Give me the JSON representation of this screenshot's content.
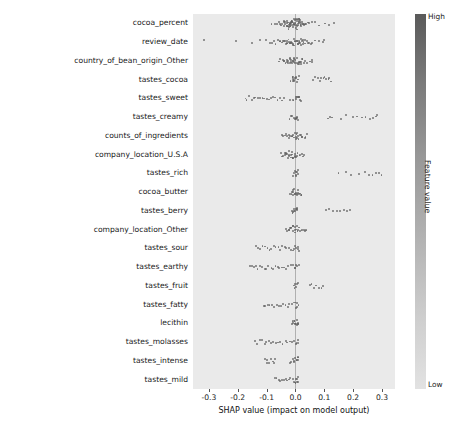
{
  "chart_data": {
    "type": "scatter",
    "title": "",
    "xlabel": "SHAP value (impact on model output)",
    "ylabel": "",
    "xlim": [
      -0.355,
      0.345
    ],
    "xticks": [
      -0.3,
      -0.2,
      -0.1,
      0.0,
      0.1,
      0.2,
      0.3
    ],
    "xticklabels": [
      "-0.3",
      "-0.2",
      "-0.1",
      "0.0",
      "0.1",
      "0.2",
      "0.3"
    ],
    "grid": false,
    "legend": {
      "position": "right",
      "title": "Feature value",
      "high_label": "High",
      "low_label": "Low"
    },
    "categories": [
      "cocoa_percent",
      "review_date",
      "country_of_bean_origin_Other",
      "tastes_cocoa",
      "tastes_sweet",
      "tastes_creamy",
      "counts_of_ingredients",
      "company_location_U.S.A",
      "tastes_rich",
      "cocoa_butter",
      "tastes_berry",
      "company_location_Other",
      "tastes_sour",
      "tastes_earthy",
      "tastes_fruit",
      "tastes_fatty",
      "lecithin",
      "tastes_molasses",
      "tastes_intense",
      "tastes_mild"
    ],
    "series": [
      {
        "name": "cocoa_percent",
        "min": -0.082,
        "max": 0.135,
        "points": [
          -0.082,
          -0.072,
          -0.066,
          -0.06,
          -0.055,
          -0.051,
          -0.048,
          -0.045,
          -0.042,
          -0.04,
          -0.038,
          -0.036,
          -0.034,
          -0.032,
          -0.03,
          -0.029,
          -0.027,
          -0.026,
          -0.024,
          -0.023,
          -0.022,
          -0.021,
          -0.02,
          -0.019,
          -0.018,
          -0.017,
          -0.016,
          -0.015,
          -0.014,
          -0.013,
          -0.012,
          -0.011,
          -0.01,
          -0.009,
          -0.008,
          -0.007,
          -0.006,
          -0.005,
          -0.004,
          -0.003,
          -0.002,
          -0.001,
          0.0,
          0.001,
          0.002,
          0.003,
          0.004,
          0.005,
          0.006,
          0.007,
          0.008,
          0.009,
          0.01,
          0.011,
          0.012,
          0.013,
          0.014,
          0.015,
          0.016,
          0.017,
          0.018,
          0.02,
          0.022,
          0.024,
          0.026,
          0.028,
          0.031,
          0.034,
          0.038,
          0.043,
          0.049,
          0.057,
          0.067,
          0.082,
          0.1,
          0.118,
          0.135
        ]
      },
      {
        "name": "review_date",
        "min": -0.32,
        "max": 0.1,
        "points": [
          -0.32,
          -0.205,
          -0.15,
          -0.12,
          -0.1,
          -0.09,
          -0.082,
          -0.075,
          -0.068,
          -0.062,
          -0.057,
          -0.052,
          -0.048,
          -0.044,
          -0.04,
          -0.037,
          -0.034,
          -0.031,
          -0.028,
          -0.026,
          -0.024,
          -0.022,
          -0.02,
          -0.018,
          -0.016,
          -0.014,
          -0.012,
          -0.01,
          -0.008,
          -0.006,
          -0.004,
          -0.002,
          0.0,
          0.002,
          0.004,
          0.006,
          0.008,
          0.01,
          0.012,
          0.014,
          0.016,
          0.018,
          0.02,
          0.022,
          0.024,
          0.026,
          0.028,
          0.031,
          0.034,
          0.038,
          0.042,
          0.047,
          0.053,
          0.06,
          0.07,
          0.082,
          0.095,
          0.1
        ]
      },
      {
        "name": "country_of_bean_origin_Other",
        "min": -0.06,
        "max": 0.06,
        "points": [
          -0.06,
          -0.052,
          -0.046,
          -0.041,
          -0.037,
          -0.034,
          -0.031,
          -0.028,
          -0.026,
          -0.024,
          -0.022,
          -0.02,
          -0.018,
          -0.016,
          -0.014,
          -0.012,
          -0.01,
          -0.008,
          -0.006,
          -0.004,
          -0.002,
          0.0,
          0.002,
          0.004,
          0.006,
          0.008,
          0.01,
          0.012,
          0.014,
          0.016,
          0.018,
          0.02,
          0.023,
          0.026,
          0.03,
          0.035,
          0.041,
          0.048,
          0.055,
          0.06
        ]
      },
      {
        "name": "tastes_cocoa",
        "min": -0.015,
        "max": 0.125,
        "points": [
          -0.015,
          -0.012,
          -0.01,
          -0.008,
          -0.006,
          -0.004,
          -0.002,
          0.0,
          0.002,
          0.004,
          0.006,
          0.008,
          0.01,
          0.06,
          0.07,
          0.078,
          0.085,
          0.09,
          0.096,
          0.102,
          0.108,
          0.115,
          0.12,
          0.125
        ]
      },
      {
        "name": "tastes_sweet",
        "min": -0.175,
        "max": 0.02,
        "points": [
          -0.175,
          -0.168,
          -0.16,
          -0.152,
          -0.145,
          -0.138,
          -0.13,
          -0.122,
          -0.115,
          -0.108,
          -0.1,
          -0.092,
          -0.085,
          -0.078,
          -0.07,
          -0.062,
          -0.055,
          -0.048,
          -0.04,
          -0.02,
          -0.01,
          -0.005,
          0.0,
          0.003,
          0.006,
          0.009,
          0.012,
          0.015,
          0.018,
          0.02
        ]
      },
      {
        "name": "tastes_creamy",
        "min": -0.02,
        "max": 0.285,
        "points": [
          -0.02,
          -0.015,
          -0.01,
          -0.006,
          -0.003,
          0.0,
          0.002,
          0.004,
          0.006,
          0.008,
          0.01,
          0.11,
          0.12,
          0.128,
          0.16,
          0.175,
          0.2,
          0.215,
          0.23,
          0.245,
          0.26,
          0.27,
          0.28,
          0.285
        ]
      },
      {
        "name": "counts_of_ingredients",
        "min": -0.05,
        "max": 0.042,
        "points": [
          -0.05,
          -0.044,
          -0.038,
          -0.033,
          -0.028,
          -0.024,
          -0.02,
          -0.016,
          -0.013,
          -0.01,
          -0.007,
          -0.005,
          -0.003,
          -0.001,
          0.0,
          0.002,
          0.004,
          0.006,
          0.008,
          0.01,
          0.013,
          0.016,
          0.02,
          0.025,
          0.03,
          0.036,
          0.042
        ]
      },
      {
        "name": "company_location_U.S.A",
        "min": -0.05,
        "max": 0.03,
        "points": [
          -0.05,
          -0.045,
          -0.041,
          -0.038,
          -0.035,
          -0.032,
          -0.03,
          -0.028,
          -0.026,
          -0.024,
          -0.022,
          -0.02,
          -0.018,
          -0.016,
          -0.014,
          -0.012,
          -0.01,
          -0.008,
          -0.006,
          -0.004,
          -0.002,
          0.0,
          0.002,
          0.005,
          0.008,
          0.012,
          0.016,
          0.02,
          0.025,
          0.03
        ]
      },
      {
        "name": "tastes_rich",
        "min": -0.01,
        "max": 0.3,
        "points": [
          -0.01,
          -0.006,
          -0.003,
          0.0,
          0.002,
          0.004,
          0.006,
          0.008,
          0.01,
          0.15,
          0.175,
          0.195,
          0.22,
          0.24,
          0.255,
          0.268,
          0.28,
          0.29,
          0.3
        ]
      },
      {
        "name": "cocoa_butter",
        "min": -0.018,
        "max": 0.02,
        "points": [
          -0.018,
          -0.015,
          -0.012,
          -0.01,
          -0.008,
          -0.006,
          -0.004,
          -0.002,
          0.0,
          0.002,
          0.004,
          0.006,
          0.008,
          0.01,
          0.012,
          0.015,
          0.018,
          0.02
        ]
      },
      {
        "name": "tastes_berry",
        "min": -0.015,
        "max": 0.19,
        "points": [
          -0.015,
          -0.011,
          -0.008,
          -0.005,
          -0.002,
          0.0,
          0.002,
          0.004,
          0.006,
          0.008,
          0.105,
          0.118,
          0.13,
          0.142,
          0.155,
          0.168,
          0.178,
          0.19
        ]
      },
      {
        "name": "company_location_Other",
        "min": -0.032,
        "max": 0.04,
        "points": [
          -0.032,
          -0.028,
          -0.025,
          -0.022,
          -0.019,
          -0.016,
          -0.013,
          -0.01,
          -0.008,
          -0.006,
          -0.004,
          -0.002,
          0.0,
          0.002,
          0.004,
          0.006,
          0.009,
          0.012,
          0.016,
          0.02,
          0.025,
          0.03,
          0.035,
          0.04
        ]
      },
      {
        "name": "tastes_sour",
        "min": -0.135,
        "max": 0.012,
        "points": [
          -0.135,
          -0.128,
          -0.12,
          -0.112,
          -0.105,
          -0.098,
          -0.09,
          -0.082,
          -0.075,
          -0.068,
          -0.06,
          -0.052,
          -0.045,
          -0.038,
          -0.03,
          -0.022,
          -0.015,
          -0.008,
          -0.003,
          0.0,
          0.003,
          0.006,
          0.009,
          0.012
        ]
      },
      {
        "name": "tastes_earthy",
        "min": -0.16,
        "max": 0.012,
        "points": [
          -0.16,
          -0.152,
          -0.145,
          -0.138,
          -0.13,
          -0.122,
          -0.115,
          -0.108,
          -0.1,
          -0.092,
          -0.085,
          -0.078,
          -0.07,
          -0.062,
          -0.055,
          -0.048,
          -0.04,
          -0.032,
          -0.025,
          -0.018,
          -0.01,
          -0.004,
          0.0,
          0.004,
          0.008,
          0.012
        ]
      },
      {
        "name": "tastes_fruit",
        "min": -0.005,
        "max": 0.095,
        "points": [
          -0.005,
          -0.002,
          0.0,
          0.002,
          0.004,
          0.006,
          0.05,
          0.058,
          0.065,
          0.072,
          0.08,
          0.088,
          0.095
        ]
      },
      {
        "name": "tastes_fatty",
        "min": -0.11,
        "max": 0.01,
        "points": [
          -0.11,
          -0.102,
          -0.095,
          -0.088,
          -0.08,
          -0.072,
          -0.065,
          -0.058,
          -0.05,
          -0.042,
          -0.035,
          -0.028,
          -0.02,
          -0.014,
          -0.008,
          -0.003,
          0.0,
          0.003,
          0.006,
          0.01
        ]
      },
      {
        "name": "lecithin",
        "min": -0.012,
        "max": 0.012,
        "points": [
          -0.012,
          -0.01,
          -0.008,
          -0.006,
          -0.004,
          -0.002,
          0.0,
          0.002,
          0.004,
          0.006,
          0.008,
          0.01,
          0.012
        ]
      },
      {
        "name": "tastes_molasses",
        "min": -0.14,
        "max": 0.01,
        "points": [
          -0.14,
          -0.132,
          -0.124,
          -0.116,
          -0.108,
          -0.1,
          -0.092,
          -0.084,
          -0.076,
          -0.068,
          -0.06,
          -0.052,
          -0.044,
          -0.036,
          -0.028,
          -0.02,
          -0.012,
          -0.006,
          0.0,
          0.004,
          0.008,
          0.01
        ]
      },
      {
        "name": "tastes_intense",
        "min": -0.105,
        "max": 0.01,
        "points": [
          -0.105,
          -0.1,
          -0.095,
          -0.09,
          -0.085,
          -0.08,
          -0.075,
          -0.07,
          -0.02,
          -0.015,
          -0.01,
          -0.006,
          -0.003,
          0.0,
          0.002,
          0.004,
          0.006,
          0.008,
          0.01
        ]
      },
      {
        "name": "tastes_mild",
        "min": -0.07,
        "max": 0.01,
        "points": [
          -0.07,
          -0.064,
          -0.058,
          -0.052,
          -0.046,
          -0.04,
          -0.034,
          -0.028,
          -0.022,
          -0.016,
          -0.01,
          -0.005,
          -0.002,
          0.0,
          0.002,
          0.004,
          0.006,
          0.008,
          0.01
        ]
      }
    ]
  },
  "colors": {
    "plot_background": "#eaeaea",
    "point": "#606060",
    "zero_line": "#b0b0b0",
    "text": "#1a1a1a"
  }
}
